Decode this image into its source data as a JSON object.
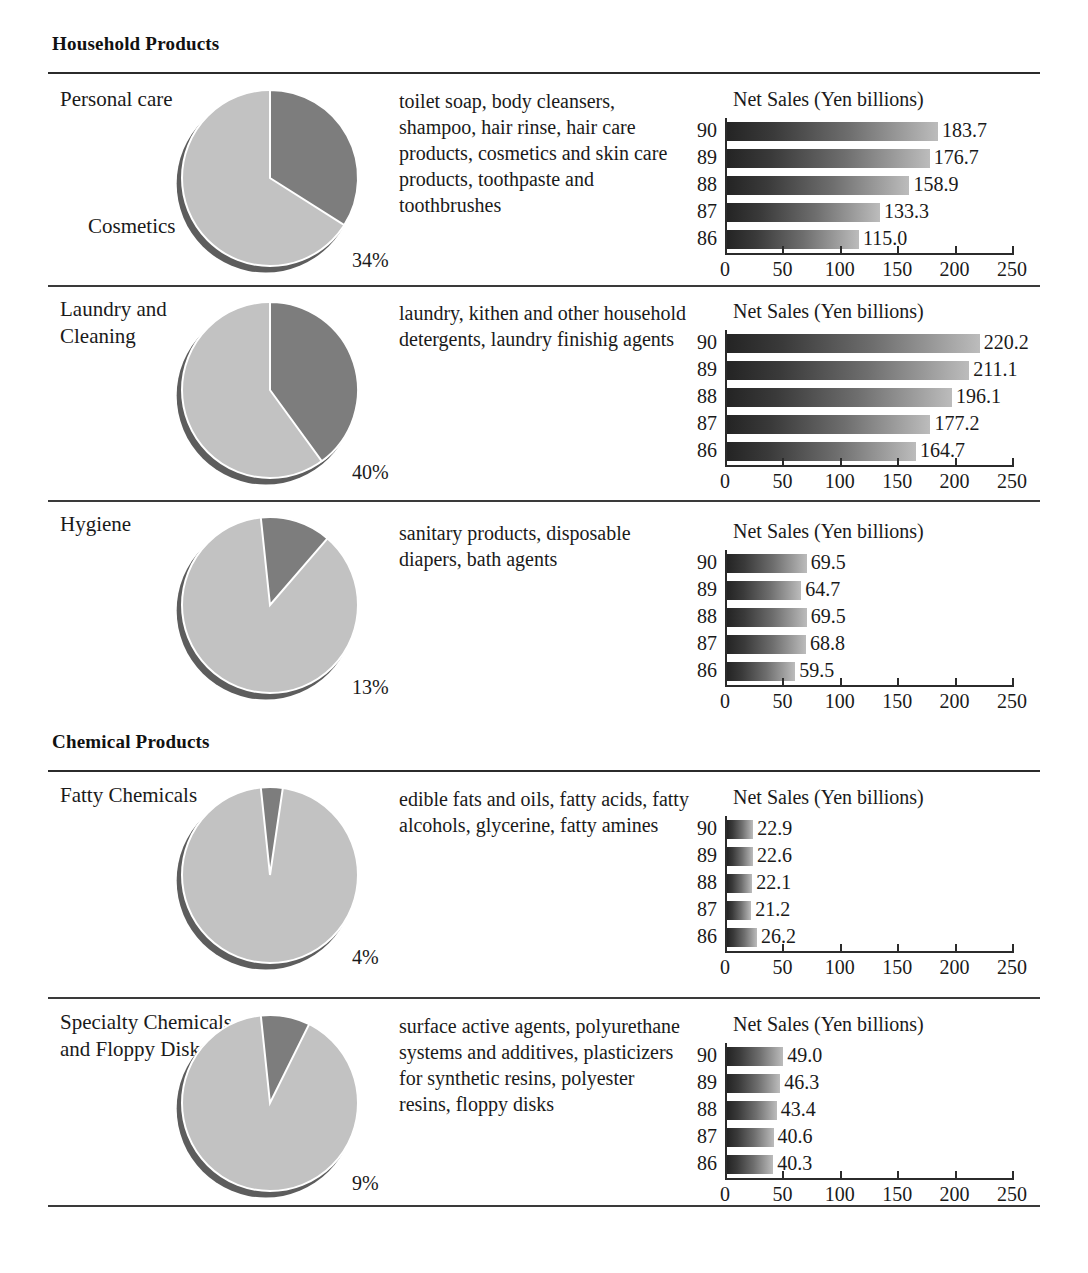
{
  "document": {
    "axis": {
      "ticks": [
        0,
        50,
        100,
        150,
        200,
        250
      ],
      "max": 250,
      "unit": "Yen billions"
    },
    "chart_title": "Net Sales (Yen billions)"
  },
  "groups": [
    {
      "heading": "Household Products",
      "rows": [
        {
          "label": "Personal care",
          "label2": "Cosmetics",
          "description": "toilet soap, body cleansers, shampoo, hair rinse, hair care products, cosmetics and skin care products, toothpaste and toothbrushes",
          "percent": "34%",
          "chart_data": {
            "type": "bar",
            "title": "Net Sales (Yen billions)",
            "orientation": "horizontal",
            "categories": [
              "90",
              "89",
              "88",
              "87",
              "86"
            ],
            "values": [
              183.7,
              176.7,
              158.9,
              133.3,
              115.0
            ],
            "labels": [
              "183.7",
              "176.7",
              "158.9",
              "133.3",
              "115.0"
            ],
            "xlabel": "",
            "ylabel": "",
            "xlim": [
              0,
              250
            ],
            "xticks": [
              0,
              50,
              100,
              150,
              200,
              250
            ],
            "grid": false,
            "legend": "none"
          },
          "pie_data": {
            "type": "pie",
            "slices": [
              {
                "name": "Personal care",
                "value": 34
              },
              {
                "name": "Cosmetics",
                "value": 66
              }
            ],
            "label": "34%"
          }
        },
        {
          "label": "Laundry and Cleaning",
          "label2": "",
          "description": "laundry, kithen and other household detergents, laundry finishig agents",
          "percent": "40%",
          "chart_data": {
            "type": "bar",
            "title": "Net Sales (Yen billions)",
            "orientation": "horizontal",
            "categories": [
              "90",
              "89",
              "88",
              "87",
              "86"
            ],
            "values": [
              220.2,
              211.1,
              196.1,
              177.2,
              164.7
            ],
            "labels": [
              "220.2",
              "211.1",
              "196.1",
              "177.2",
              "164.7"
            ],
            "xlabel": "",
            "ylabel": "",
            "xlim": [
              0,
              250
            ],
            "xticks": [
              0,
              50,
              100,
              150,
              200,
              250
            ],
            "grid": false,
            "legend": "none"
          },
          "pie_data": {
            "type": "pie",
            "slices": [
              {
                "name": "Laundry and Cleaning",
                "value": 40
              },
              {
                "name": "Other",
                "value": 60
              }
            ],
            "label": "40%"
          }
        },
        {
          "label": "Hygiene",
          "label2": "",
          "description": "sanitary products, disposable diapers, bath agents",
          "percent": "13%",
          "chart_data": {
            "type": "bar",
            "title": "Net Sales (Yen billions)",
            "orientation": "horizontal",
            "categories": [
              "90",
              "89",
              "88",
              "87",
              "86"
            ],
            "values": [
              69.5,
              64.7,
              69.5,
              68.8,
              59.5
            ],
            "labels": [
              "69.5",
              "64.7",
              "69.5",
              "68.8",
              "59.5"
            ],
            "xlabel": "",
            "ylabel": "",
            "xlim": [
              0,
              250
            ],
            "xticks": [
              0,
              50,
              100,
              150,
              200,
              250
            ],
            "grid": false,
            "legend": "none"
          },
          "pie_data": {
            "type": "pie",
            "slices": [
              {
                "name": "Hygiene",
                "value": 13
              },
              {
                "name": "Other",
                "value": 87
              }
            ],
            "label": "13%"
          }
        }
      ]
    },
    {
      "heading": "Chemical Products",
      "rows": [
        {
          "label": "Fatty Chemicals",
          "label2": "",
          "description": "edible fats and oils, fatty acids, fatty alcohols, glycerine, fatty amines",
          "percent": "4%",
          "chart_data": {
            "type": "bar",
            "title": "Net Sales (Yen billions)",
            "orientation": "horizontal",
            "categories": [
              "90",
              "89",
              "88",
              "87",
              "86"
            ],
            "values": [
              22.9,
              22.6,
              22.1,
              21.2,
              26.2
            ],
            "labels": [
              "22.9",
              "22.6",
              "22.1",
              "21.2",
              "26.2"
            ],
            "xlabel": "",
            "ylabel": "",
            "xlim": [
              0,
              250
            ],
            "xticks": [
              0,
              50,
              100,
              150,
              200,
              250
            ],
            "grid": false,
            "legend": "none"
          },
          "pie_data": {
            "type": "pie",
            "slices": [
              {
                "name": "Fatty Chemicals",
                "value": 4
              },
              {
                "name": "Other",
                "value": 96
              }
            ],
            "label": "4%"
          }
        },
        {
          "label": "Specialty Chemicals and Floppy Disks",
          "label2": "",
          "description": "surface active agents, polyurethane systems and additives, plasticizers for synthetic resins, polyester resins, floppy disks",
          "percent": "9%",
          "chart_data": {
            "type": "bar",
            "title": "Net Sales (Yen billions)",
            "orientation": "horizontal",
            "categories": [
              "90",
              "89",
              "88",
              "87",
              "86"
            ],
            "values": [
              49.0,
              46.3,
              43.4,
              40.6,
              40.3
            ],
            "labels": [
              "49.0",
              "46.3",
              "43.4",
              "40.6",
              "40.3"
            ],
            "xlabel": "",
            "ylabel": "",
            "xlim": [
              0,
              250
            ],
            "xticks": [
              0,
              50,
              100,
              150,
              200,
              250
            ],
            "grid": false,
            "legend": "none"
          },
          "pie_data": {
            "type": "pie",
            "slices": [
              {
                "name": "Specialty Chemicals and Floppy Disks",
                "value": 9
              },
              {
                "name": "Other",
                "value": 91
              }
            ],
            "label": "9%"
          }
        }
      ]
    }
  ],
  "colors": {
    "pie_highlight": "#7d7d7d",
    "pie_base": "#c2c2c2",
    "pie_shadow": "#5d5d5d",
    "bar_dark": "#242424",
    "bar_light": "#bcbcbc",
    "rule": "#2b2b2b",
    "text": "#1a1a1a"
  }
}
